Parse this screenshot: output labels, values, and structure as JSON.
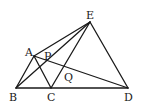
{
  "diagram": {
    "type": "geometry-figure",
    "points": {
      "A": {
        "label": "A"
      },
      "B": {
        "label": "B"
      },
      "C": {
        "label": "C"
      },
      "D": {
        "label": "D"
      },
      "E": {
        "label": "E"
      },
      "P": {
        "label": "P"
      },
      "Q": {
        "label": "Q"
      }
    },
    "segments": [
      [
        "B",
        "D"
      ],
      [
        "A",
        "B"
      ],
      [
        "A",
        "C"
      ],
      [
        "A",
        "E"
      ],
      [
        "A",
        "D"
      ],
      [
        "B",
        "E"
      ],
      [
        "C",
        "E"
      ],
      [
        "E",
        "D"
      ]
    ],
    "intersections": {
      "P": [
        "AD",
        "BE"
      ],
      "Q": [
        "AD",
        "CE"
      ]
    }
  }
}
